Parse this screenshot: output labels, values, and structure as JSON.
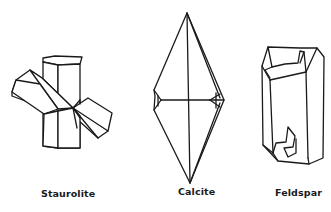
{
  "figure": {
    "crystals": [
      {
        "id": "staurolite",
        "label": "Staurolite"
      },
      {
        "id": "calcite",
        "label": "Calcite"
      },
      {
        "id": "feldspar",
        "label": "Feldspar"
      }
    ]
  }
}
